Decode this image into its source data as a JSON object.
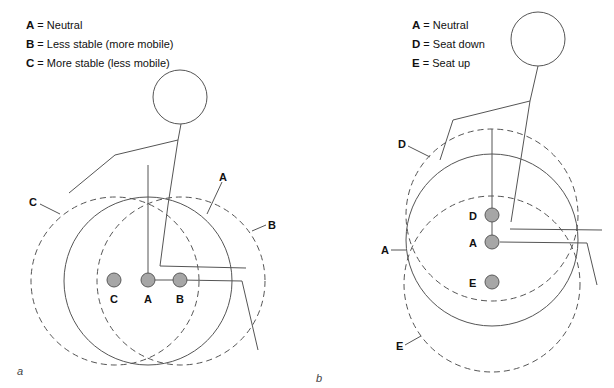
{
  "panel_a": {
    "letter": "a",
    "legend": [
      {
        "key": "A",
        "sep": " = ",
        "text": "Neutral"
      },
      {
        "key": "B",
        "sep": " = ",
        "text": "Less stable (more mobile)"
      },
      {
        "key": "C",
        "sep": " = ",
        "text": "More stable (less mobile)"
      }
    ],
    "circle_labels": {
      "c": "C",
      "a": "A",
      "b": "B"
    },
    "dot_labels": {
      "c": "C",
      "a": "A",
      "b": "B"
    }
  },
  "panel_b": {
    "letter": "b",
    "legend": [
      {
        "key": "A",
        "sep": " = ",
        "text": "Neutral"
      },
      {
        "key": "D",
        "sep": " = ",
        "text": "Seat down"
      },
      {
        "key": "E",
        "sep": " = ",
        "text": "Seat up"
      }
    ],
    "circle_labels": {
      "d": "D",
      "a": "A",
      "e": "E"
    },
    "dot_labels": {
      "d": "D",
      "a": "A",
      "e": "E"
    }
  },
  "colors": {
    "line": "#555555",
    "dot_fill": "#a6a6a6",
    "dot_stroke": "#5a5a5a"
  }
}
